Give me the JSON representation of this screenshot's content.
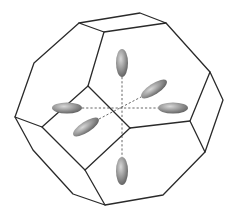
{
  "figure": {
    "colors": {
      "edge": "#2a2a2a",
      "axis": "#555555",
      "ellipsoid_light": "#c8c8c8",
      "ellipsoid_dark": "#707070"
    },
    "vertices": {
      "top_a": [
        79,
        23
      ],
      "top_b": [
        140,
        13
      ],
      "top_c": [
        166,
        23
      ],
      "top_d": [
        104,
        32
      ],
      "left_upper": [
        34,
        63
      ],
      "left_tip": [
        15,
        117
      ],
      "left_inner": [
        42,
        127
      ],
      "left_lower": [
        33,
        150
      ],
      "inner_upper": [
        88,
        86
      ],
      "center": [
        130,
        128
      ],
      "inner_lower": [
        85,
        170
      ],
      "right_upper": [
        210,
        72
      ],
      "right_tip": [
        223,
        100
      ],
      "right_inner": [
        190,
        121
      ],
      "right_lower": [
        205,
        152
      ],
      "bottom_left": [
        73,
        194
      ],
      "bottom_tip": [
        105,
        205
      ],
      "bottom_right": [
        163,
        195
      ]
    },
    "axes_origin": [
      122,
      117
    ],
    "ellipsoids": [
      {
        "name": "top",
        "cx": 122,
        "cy": 63,
        "rx": 6,
        "ry": 14,
        "rotate": 0
      },
      {
        "name": "bottom",
        "cx": 122,
        "cy": 171,
        "rx": 6,
        "ry": 14,
        "rotate": 0
      },
      {
        "name": "left",
        "cx": 67,
        "cy": 108,
        "rx": 15,
        "ry": 5.5,
        "rotate": 0
      },
      {
        "name": "right",
        "cx": 173,
        "cy": 108,
        "rx": 15,
        "ry": 5.5,
        "rotate": 0
      },
      {
        "name": "back-right",
        "cx": 154,
        "cy": 89,
        "rx": 15,
        "ry": 5.5,
        "rotate": -33
      },
      {
        "name": "front-left",
        "cx": 86,
        "cy": 127,
        "rx": 15,
        "ry": 5.5,
        "rotate": -33
      }
    ]
  }
}
